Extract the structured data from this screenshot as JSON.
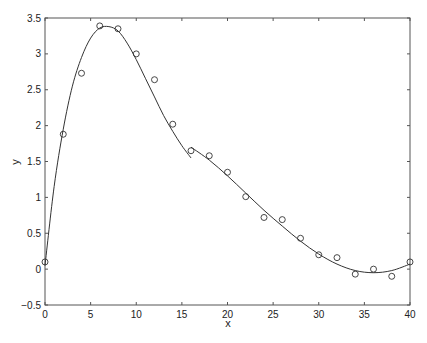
{
  "chart_data": {
    "type": "scatter",
    "title": "",
    "xlabel": "x",
    "ylabel": "y",
    "xlim": [
      0,
      40
    ],
    "ylim": [
      -0.5,
      3.5
    ],
    "xticks": [
      0,
      5,
      10,
      15,
      20,
      25,
      30,
      35,
      40
    ],
    "yticks": [
      -0.5,
      0,
      0.5,
      1,
      1.5,
      2,
      2.5,
      3,
      3.5
    ],
    "xtick_labels": [
      "0",
      "5",
      "10",
      "15",
      "20",
      "25",
      "30",
      "35",
      "40"
    ],
    "ytick_labels": [
      "−0.5",
      "0",
      "0.5",
      "1",
      "1.5",
      "2",
      "2.5",
      "3",
      "3.5"
    ],
    "grid": false,
    "legend": null,
    "series": [
      {
        "name": "data",
        "style": "markers-circle-open",
        "x": [
          0,
          2,
          4,
          6,
          8,
          10,
          12,
          14,
          16,
          18,
          20,
          22,
          24,
          26,
          28,
          30,
          32,
          34,
          36,
          38,
          40
        ],
        "y": [
          0.1,
          1.88,
          2.73,
          3.39,
          3.35,
          3.0,
          2.64,
          2.02,
          1.65,
          1.58,
          1.35,
          1.01,
          0.72,
          0.69,
          0.43,
          0.2,
          0.16,
          -0.07,
          0.0,
          -0.1,
          0.1
        ]
      },
      {
        "name": "fit segment 1",
        "style": "line",
        "x": [
          0,
          1,
          2,
          3,
          4,
          5,
          6,
          7,
          8,
          9,
          10,
          11,
          12,
          13,
          14,
          15,
          16
        ],
        "y": [
          0.05,
          1.15,
          1.95,
          2.55,
          2.95,
          3.22,
          3.36,
          3.38,
          3.32,
          3.15,
          2.92,
          2.66,
          2.4,
          2.14,
          1.92,
          1.72,
          1.55
        ]
      },
      {
        "name": "fit segment 2",
        "style": "line",
        "x": [
          16,
          18,
          20,
          22,
          24,
          26,
          28,
          30,
          32,
          34,
          36,
          38,
          40
        ],
        "y": [
          1.7,
          1.52,
          1.3,
          1.06,
          0.82,
          0.6,
          0.39,
          0.21,
          0.07,
          -0.02,
          -0.05,
          -0.02,
          0.07
        ]
      }
    ],
    "caption": "Figure"
  }
}
